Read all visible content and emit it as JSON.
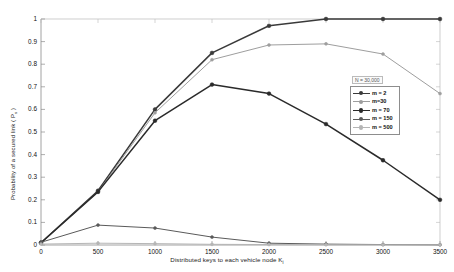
{
  "chart_data": {
    "type": "line",
    "title": "",
    "xlabel": "Distributed keys to  each vehicle node K",
    "xlabel_subscript": "i",
    "ylabel": "Probability of a secured link ( P",
    "ylabel_subscript": "s",
    "ylabel_suffix": " )",
    "x": [
      0,
      500,
      1000,
      1500,
      2000,
      2500,
      3000,
      3500
    ],
    "xticks": [
      "0",
      "500",
      "1000",
      "1500",
      "2000",
      "2500",
      "3000",
      "3500"
    ],
    "yticks": [
      "0",
      "0.1",
      "0.2",
      "0.3",
      "0.4",
      "0.5",
      "0.6",
      "0.7",
      "0.8",
      "0.9",
      "1"
    ],
    "xlim": [
      0,
      3500
    ],
    "ylim": [
      0,
      1
    ],
    "grid": false,
    "legend_position": "right-middle",
    "legend_title": "N = 30,000",
    "series": [
      {
        "name": "m = 2",
        "color": "#3a3a3a",
        "values": [
          0.01,
          0.24,
          0.6,
          0.85,
          0.97,
          1.0,
          1.0,
          1.0
        ]
      },
      {
        "name": "m=30",
        "color": "#9e9e9e",
        "values": [
          0.01,
          0.235,
          0.585,
          0.82,
          0.885,
          0.89,
          0.845,
          0.67
        ]
      },
      {
        "name": "m = 70",
        "color": "#2a2a2a",
        "values": [
          0.01,
          0.235,
          0.55,
          0.71,
          0.67,
          0.535,
          0.375,
          0.2
        ]
      },
      {
        "name": "m = 150",
        "color": "#5a5a5a",
        "values": [
          0.012,
          0.088,
          0.075,
          0.035,
          0.008,
          0.004,
          0.002,
          0.001
        ]
      },
      {
        "name": "m = 500",
        "color": "#b5b5b5",
        "values": [
          0.004,
          0.008,
          0.006,
          0.003,
          0.002,
          0.001,
          0.001,
          0.001
        ]
      }
    ]
  }
}
